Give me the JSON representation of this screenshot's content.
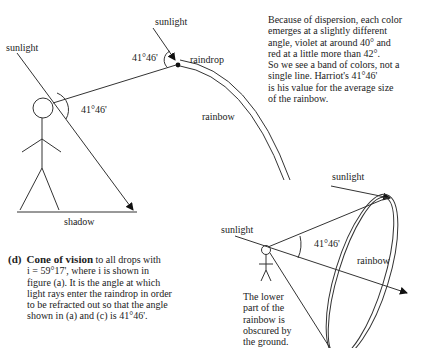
{
  "figure_top": {
    "caption_fragment": "(c) Rainbow as seen by observer",
    "labels": {
      "sunlight_left": "sunlight",
      "sunlight_drop": "sunlight",
      "angle_observer": "41°46'",
      "angle_drop": "41°46'",
      "raindrop": "raindrop",
      "rainbow": "rainbow",
      "shadow": "shadow"
    }
  },
  "dispersion_note": {
    "lines": [
      "Because of dispersion, each color",
      "emerges at a slightly different",
      "angle, violet at around 40° and",
      "red at a little more than 42°.",
      "So we see a band of colors, not a",
      "single line. Harriot's 41°46'",
      "is his value for the average size",
      "of the rainbow."
    ]
  },
  "figure_cone": {
    "labels": {
      "sunlight_top": "sunlight",
      "sunlight_left": "sunlight",
      "angle": "41°46'",
      "rainbow": "rainbow"
    },
    "ground_note": [
      "The lower",
      "part of the",
      "rainbow is",
      "obscured by",
      "the ground."
    ]
  },
  "caption_d": {
    "label": "(d)",
    "title": "Cone of vision",
    "lines": [
      "to all drops with",
      "i = 59°17', where i is shown in",
      "figure (a). It is the angle at which",
      "light rays enter the raindrop in order",
      "to be refracted out so that the angle",
      "shown in (a) and (c) is 41°46'."
    ]
  }
}
